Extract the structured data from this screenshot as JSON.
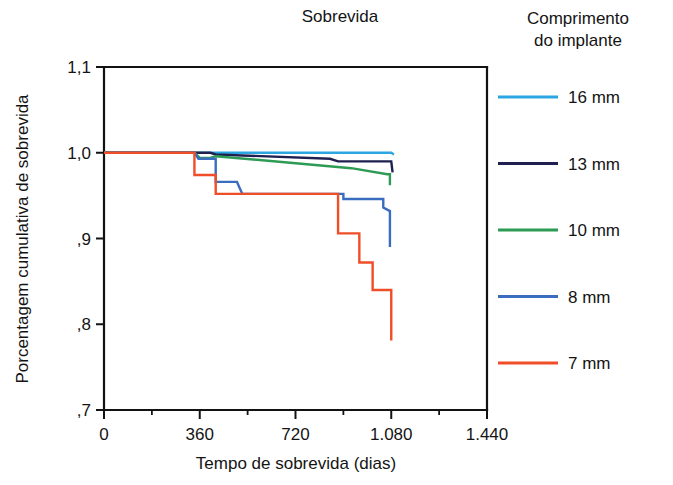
{
  "chart_data": {
    "type": "line",
    "subtype": "kaplan-meier-step",
    "title": "Sobrevida",
    "xlabel": "Tempo de sobrevida (dias)",
    "ylabel": "Porcentagem cumulativa de sobrevida",
    "xlim": [
      0,
      1440
    ],
    "ylim": [
      0.7,
      1.1
    ],
    "grid": false,
    "x_ticks": [
      0,
      360,
      720,
      1080,
      1440
    ],
    "x_tick_labels": [
      "0",
      "360",
      "720",
      "1.080",
      "1.440"
    ],
    "x_minor_ticks": [
      180,
      540,
      900,
      1260
    ],
    "y_ticks": [
      0.7,
      0.8,
      0.9,
      1.0,
      1.1
    ],
    "y_tick_labels": [
      ",7",
      ",8",
      ",9",
      "1,0",
      "1,1"
    ],
    "legend_title_line1": "Comprimento",
    "legend_title_line2": "do implante",
    "legend_position": "right",
    "series": [
      {
        "name": "16 mm",
        "label": "16 mm",
        "color": "#2CA6E0",
        "points": [
          [
            0,
            1.0
          ],
          [
            1080,
            1.0
          ],
          [
            1090,
            0.998
          ],
          [
            1090,
            0.998
          ]
        ]
      },
      {
        "name": "13 mm",
        "label": "13 mm",
        "color": "#1F2050",
        "points": [
          [
            0,
            1.0
          ],
          [
            400,
            1.0
          ],
          [
            420,
            0.998
          ],
          [
            850,
            0.993
          ],
          [
            880,
            0.99
          ],
          [
            1080,
            0.99
          ],
          [
            1085,
            0.977
          ]
        ]
      },
      {
        "name": "10 mm",
        "label": "10 mm",
        "color": "#2E9B55",
        "points": [
          [
            0,
            1.0
          ],
          [
            340,
            1.0
          ],
          [
            360,
            0.994
          ],
          [
            400,
            0.994
          ],
          [
            420,
            0.996
          ],
          [
            930,
            0.982
          ],
          [
            1065,
            0.975
          ],
          [
            1075,
            0.975
          ],
          [
            1075,
            0.962
          ]
        ]
      },
      {
        "name": "8 mm",
        "label": "8 mm",
        "color": "#3A6CC0",
        "points": [
          [
            0,
            1.0
          ],
          [
            340,
            1.0
          ],
          [
            355,
            0.993
          ],
          [
            420,
            0.993
          ],
          [
            420,
            0.966
          ],
          [
            500,
            0.966
          ],
          [
            520,
            0.952
          ],
          [
            900,
            0.952
          ],
          [
            900,
            0.946
          ],
          [
            1050,
            0.946
          ],
          [
            1050,
            0.936
          ],
          [
            1075,
            0.932
          ],
          [
            1075,
            0.89
          ]
        ]
      },
      {
        "name": "7 mm",
        "label": "7 mm",
        "color": "#F04E28",
        "points": [
          [
            0,
            1.0
          ],
          [
            340,
            1.0
          ],
          [
            340,
            0.974
          ],
          [
            420,
            0.974
          ],
          [
            420,
            0.952
          ],
          [
            880,
            0.952
          ],
          [
            880,
            0.906
          ],
          [
            960,
            0.906
          ],
          [
            960,
            0.872
          ],
          [
            1010,
            0.872
          ],
          [
            1010,
            0.84
          ],
          [
            1080,
            0.84
          ],
          [
            1080,
            0.781
          ]
        ]
      }
    ]
  }
}
